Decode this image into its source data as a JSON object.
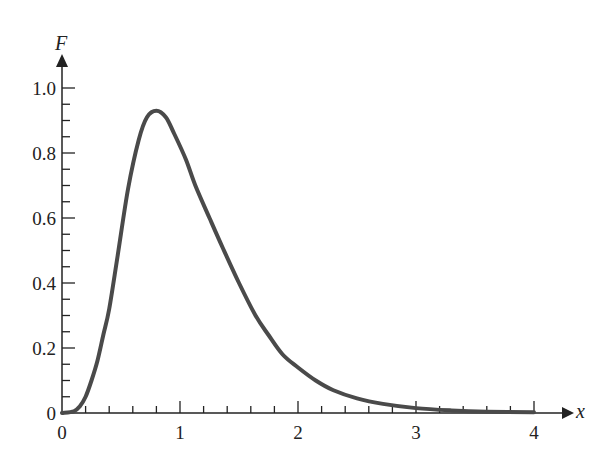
{
  "chart_data": {
    "type": "line",
    "title": "",
    "xlabel": "x",
    "ylabel": "F",
    "xlim": [
      0,
      4
    ],
    "ylim": [
      0,
      1.0
    ],
    "grid": false,
    "legend": null,
    "x_ticks": [
      "0",
      "1",
      "2",
      "3",
      "4"
    ],
    "y_ticks": [
      "0",
      "0.2",
      "0.4",
      "0.6",
      "0.8",
      "1.0"
    ],
    "x_minor_step": 0.2,
    "y_minor_step": 0.05,
    "series": [
      {
        "name": "F(x)",
        "color": "#4a4a4a",
        "x": [
          0,
          0.1,
          0.15,
          0.2,
          0.25,
          0.3,
          0.35,
          0.4,
          0.47,
          0.56,
          0.65,
          0.72,
          0.8,
          0.88,
          0.95,
          1.05,
          1.13,
          1.25,
          1.36,
          1.5,
          1.64,
          1.75,
          1.87,
          2.0,
          2.15,
          2.3,
          2.5,
          2.72,
          3.0,
          3.3,
          3.6,
          4.0
        ],
        "y": [
          0,
          0.005,
          0.02,
          0.05,
          0.1,
          0.16,
          0.24,
          0.32,
          0.48,
          0.69,
          0.84,
          0.91,
          0.93,
          0.91,
          0.86,
          0.78,
          0.7,
          0.6,
          0.51,
          0.4,
          0.3,
          0.24,
          0.18,
          0.14,
          0.1,
          0.07,
          0.045,
          0.028,
          0.015,
          0.008,
          0.004,
          0.002
        ]
      }
    ],
    "annotations": []
  }
}
